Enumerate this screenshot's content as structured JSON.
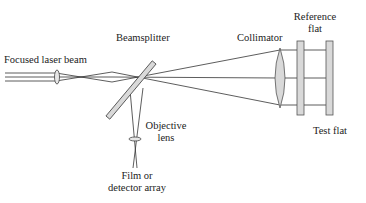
{
  "labels": {
    "focused_laser_beam": "Focused laser beam",
    "beamsplitter": "Beamsplitter",
    "collimator": "Collimator",
    "reference_flat_line1": "Reference",
    "reference_flat_line2": "flat",
    "objective_line1": "Objective",
    "objective_line2": "lens",
    "film_line1": "Film or",
    "film_line2": "detector array",
    "test_flat": "Test flat"
  },
  "colors": {
    "line": "#333333",
    "optic_fill": "#d9d9d9",
    "optic_stroke": "#555555"
  }
}
